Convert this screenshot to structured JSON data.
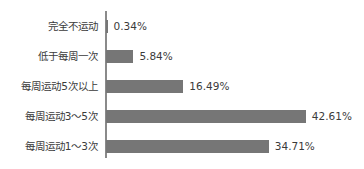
{
  "chart_data": {
    "type": "bar",
    "orientation": "horizontal",
    "title": "",
    "xlabel": "",
    "ylabel": "",
    "grid": false,
    "legend": null,
    "xlim": [
      0,
      50
    ],
    "value_suffix": "%",
    "axis_color": "#8a8a8a",
    "bar_color": "#767676",
    "text_color": "#3b3b3b",
    "background": "#ffffff",
    "categories": [
      "完全不运动",
      "低于每周一次",
      "每周运动5次以上",
      "每周运动3～5次",
      "每周运动1～3次"
    ],
    "values": [
      0.34,
      5.84,
      16.49,
      42.61,
      34.71
    ],
    "value_labels": [
      "0.34%",
      "5.84%",
      "16.49%",
      "42.61%",
      "34.71%"
    ],
    "rows": [
      {
        "label": "完全不运动",
        "value": 0.34,
        "value_label": "0.34%"
      },
      {
        "label": "低于每周一次",
        "value": 5.84,
        "value_label": "5.84%"
      },
      {
        "label": "每周运动5次以上",
        "value": 16.49,
        "value_label": "16.49%"
      },
      {
        "label": "每周运动3～5次",
        "value": 42.61,
        "value_label": "42.61%"
      },
      {
        "label": "每周运动1～3次",
        "value": 34.71,
        "value_label": "34.71%"
      }
    ]
  }
}
